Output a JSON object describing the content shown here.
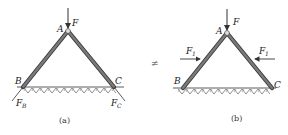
{
  "figure_a": {
    "caption": "(a)",
    "labels": {
      "A": "A",
      "B": "B",
      "C": "C",
      "F": "F",
      "FB": "F",
      "FB_sub": "B",
      "FC": "F",
      "FC_sub": "C"
    }
  },
  "figure_b": {
    "caption": "(b)",
    "labels": {
      "A": "A",
      "B": "B",
      "C": "C",
      "F": "F",
      "F1_left": "F",
      "F1_left_sub": "1",
      "F1_right": "F",
      "F1_right_sub": "1"
    }
  },
  "relation_symbol": "≠",
  "colors": {
    "member_fill": "#6b6b6b",
    "member_edge": "#3a3a3a",
    "line": "#333333",
    "hinge": "#cccccc"
  }
}
